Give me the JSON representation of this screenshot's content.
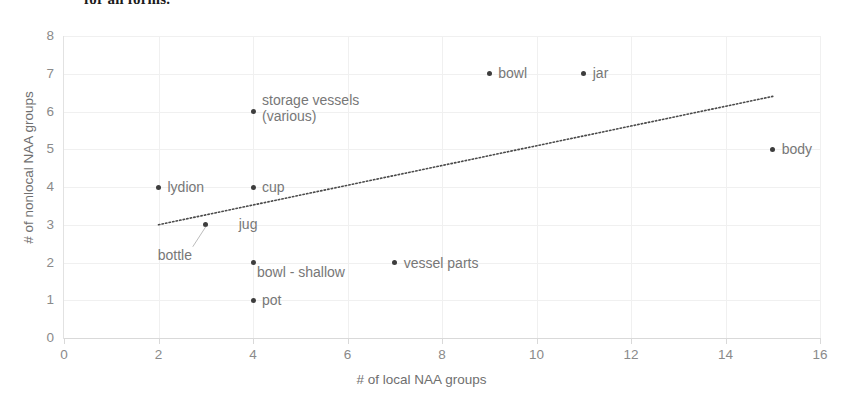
{
  "cropped_caption": "for all forms.",
  "chart_data": {
    "type": "scatter",
    "title": "",
    "xlabel": "# of local NAA groups",
    "ylabel": "# of nonlocal NAA groups",
    "xlim": [
      0,
      16
    ],
    "ylim": [
      0,
      8
    ],
    "xticks": [
      0,
      2,
      4,
      6,
      8,
      10,
      12,
      14,
      16
    ],
    "yticks": [
      0,
      1,
      2,
      3,
      4,
      5,
      6,
      7,
      8
    ],
    "grid": true,
    "legend": "none",
    "point_color": "#3d3d3d",
    "label_color": "#777777",
    "trendline": {
      "style": "dotted",
      "color": "#4a4a4a",
      "x_start": 2,
      "y_start": 3.0,
      "x_end": 15,
      "y_end": 6.4
    },
    "points": [
      {
        "label": "lydion",
        "x": 2,
        "y": 4
      },
      {
        "label": "cup",
        "x": 4,
        "y": 4
      },
      {
        "label": "storage vessels (various)",
        "x": 4,
        "y": 6
      },
      {
        "label": "jug",
        "x": 3,
        "y": 3
      },
      {
        "label": "bottle",
        "x": 3,
        "y": 3
      },
      {
        "label": "bowl - shallow",
        "x": 4,
        "y": 2
      },
      {
        "label": "pot",
        "x": 4,
        "y": 1
      },
      {
        "label": "vessel parts",
        "x": 7,
        "y": 2
      },
      {
        "label": "bowl",
        "x": 9,
        "y": 7
      },
      {
        "label": "jar",
        "x": 11,
        "y": 7
      },
      {
        "label": "body",
        "x": 15,
        "y": 5
      }
    ]
  }
}
